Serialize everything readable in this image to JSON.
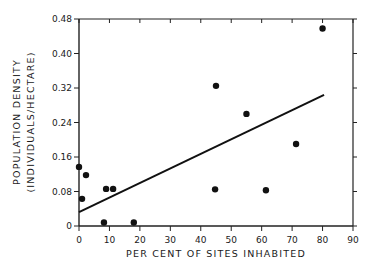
{
  "chart_data": {
    "type": "scatter",
    "title": "",
    "xlabel": "PER CENT OF SITES INHABITED",
    "ylabel_line1": "POPULATION DENSITY",
    "ylabel_line2": "(INDIVIDUALS/HECTARE)",
    "xlim": [
      0,
      90
    ],
    "ylim": [
      0,
      0.48
    ],
    "x_ticks": [
      0,
      10,
      20,
      30,
      40,
      50,
      60,
      70,
      80,
      90
    ],
    "x_tick_labels": [
      "0",
      "10",
      "20",
      "30",
      "40",
      "50",
      "60",
      "70",
      "80",
      "90"
    ],
    "y_ticks": [
      0,
      0.08,
      0.16,
      0.24,
      0.32,
      0.4,
      0.48
    ],
    "y_tick_labels": [
      "0",
      "0.08",
      "0.16",
      "0.24",
      "0.32",
      "0.40",
      "0.48"
    ],
    "grid": false,
    "legend": "none",
    "points": [
      {
        "x": 0,
        "y": 0.137
      },
      {
        "x": 1,
        "y": 0.063
      },
      {
        "x": 2.3,
        "y": 0.118
      },
      {
        "x": 8.2,
        "y": 0.008
      },
      {
        "x": 8.9,
        "y": 0.086
      },
      {
        "x": 11.2,
        "y": 0.086
      },
      {
        "x": 18,
        "y": 0.008
      },
      {
        "x": 44.7,
        "y": 0.085
      },
      {
        "x": 45,
        "y": 0.325
      },
      {
        "x": 55,
        "y": 0.26
      },
      {
        "x": 61.4,
        "y": 0.083
      },
      {
        "x": 71.3,
        "y": 0.19
      },
      {
        "x": 80,
        "y": 0.458
      }
    ],
    "fit_line": {
      "x": [
        0,
        80.5
      ],
      "y": [
        0.032,
        0.304
      ]
    },
    "colors": {
      "marks": "#111111",
      "axes": "#222222"
    }
  }
}
